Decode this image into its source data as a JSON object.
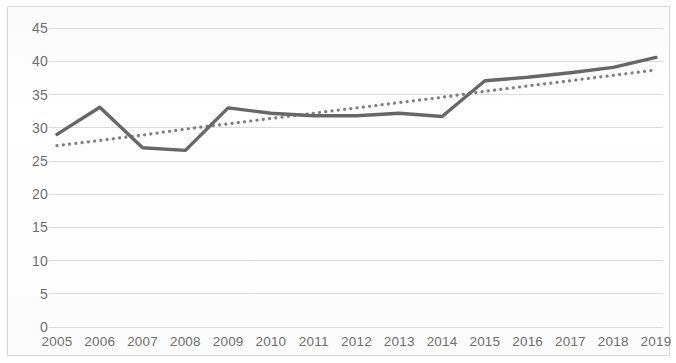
{
  "chart_data": {
    "type": "line",
    "title": "",
    "subtitle": "",
    "xlabel": "",
    "ylabel": "",
    "categories": [
      "2005",
      "2006",
      "2007",
      "2008",
      "2009",
      "2010",
      "2011",
      "2012",
      "2013",
      "2014",
      "2015",
      "2016",
      "2017",
      "2018",
      "2019"
    ],
    "series": [
      {
        "name": "Value",
        "style": "solid",
        "color": "#5a5a5a",
        "values": [
          29.0,
          33.1,
          27.0,
          26.6,
          33.0,
          32.2,
          31.8,
          31.8,
          32.2,
          31.7,
          37.1,
          37.6,
          38.3,
          39.1,
          40.6
        ]
      },
      {
        "name": "Trendline",
        "style": "dotted",
        "color": "#6a6a6a",
        "values": [
          27.3,
          28.1,
          28.9,
          29.8,
          30.6,
          31.4,
          32.2,
          33.0,
          33.8,
          34.6,
          35.5,
          36.3,
          37.1,
          37.9,
          38.7
        ]
      }
    ],
    "ylim": [
      0,
      45
    ],
    "yticks": [
      0,
      5,
      10,
      15,
      20,
      25,
      30,
      35,
      40,
      45
    ],
    "ytick_labels": [
      "0",
      "5",
      "10",
      "15",
      "20",
      "25",
      "30",
      "35",
      "40",
      "45"
    ],
    "grid": {
      "horizontal": true,
      "vertical": false,
      "color": "#dcdcdc"
    },
    "legend": {
      "visible": false,
      "position": "none"
    },
    "frame": {
      "border": true,
      "border_color": "#d8d8d8"
    }
  }
}
